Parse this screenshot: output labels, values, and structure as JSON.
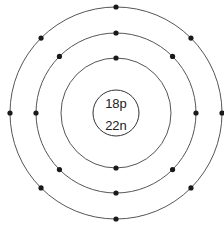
{
  "diagram": {
    "type": "bohr-atom-model",
    "center": [
      116,
      113
    ],
    "colors": {
      "shell": "#555555",
      "electron": "#1a1a1a",
      "text": "#222222",
      "background": "#ffffff"
    },
    "nucleus": {
      "radius": 23,
      "protons_label": "18p",
      "neutrons_label": "22n"
    },
    "shells": [
      {
        "name": "shell-1",
        "radius": 55,
        "electrons": 2
      },
      {
        "name": "shell-2",
        "radius": 80,
        "electrons": 8
      },
      {
        "name": "shell-3",
        "radius": 106,
        "electrons": 8
      }
    ]
  }
}
